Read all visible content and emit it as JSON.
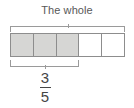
{
  "diagram": {
    "type": "fraction-bar-model",
    "title": "The whole",
    "total_parts": 5,
    "shaded_parts": 3,
    "cells": [
      {
        "index": 1,
        "shaded": true
      },
      {
        "index": 2,
        "shaded": true
      },
      {
        "index": 3,
        "shaded": true
      },
      {
        "index": 4,
        "shaded": false
      },
      {
        "index": 5,
        "shaded": false
      }
    ],
    "whole_bracket": {
      "label": "The whole",
      "spans_parts": 5
    },
    "part_bracket": {
      "spans_parts": 3
    },
    "fraction": {
      "numerator": "3",
      "denominator": "5",
      "text": "3/5"
    },
    "colors": {
      "shaded_fill": "#d6d6d4",
      "unshaded_fill": "#ffffff",
      "cell_border": "#8d8d8d",
      "bracket": "#9a9a9a",
      "text": "#585858",
      "background": "#ffffff"
    }
  }
}
